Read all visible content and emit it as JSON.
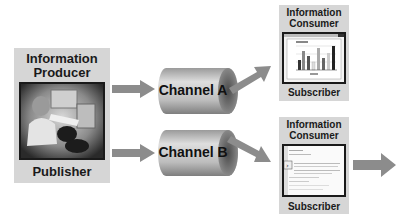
{
  "producer": {
    "title_line1": "Information",
    "title_line2": "Producer",
    "footer": "Publisher",
    "image": "people-at-computers-photo"
  },
  "channels": [
    {
      "label": "Channel A"
    },
    {
      "label": "Channel B"
    }
  ],
  "consumers": [
    {
      "title_line1": "Information",
      "title_line2": "Consumer",
      "footer": "Subscriber",
      "screen": "bar-chart-window"
    },
    {
      "title_line1": "Information",
      "title_line2": "Consumer",
      "footer": "Subscriber",
      "screen": "text-document-window"
    }
  ],
  "colors": {
    "panel": "#d6d6d6",
    "arrow": "#8c8c8c",
    "cylinder": "#b5b5b5",
    "text": "#1a1a1a"
  }
}
